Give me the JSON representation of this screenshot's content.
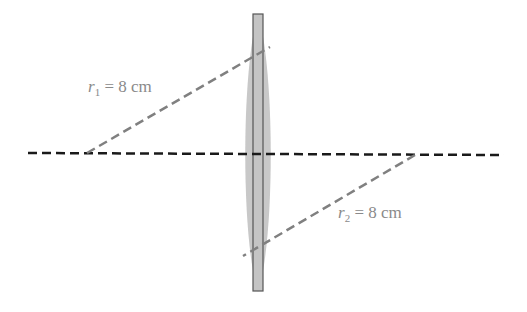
{
  "diagram": {
    "type": "thin lens cross-section",
    "labels": {
      "r1": {
        "var": "r",
        "sub": "1",
        "text": " = 8 cm"
      },
      "r2": {
        "var": "r",
        "sub": "2",
        "text": " = 8 cm"
      }
    },
    "colors": {
      "lens_fill": "#c8c8c8",
      "axis": "#1a1a1a",
      "radius_lines": "#808080",
      "label": "#8a8a8a"
    }
  }
}
